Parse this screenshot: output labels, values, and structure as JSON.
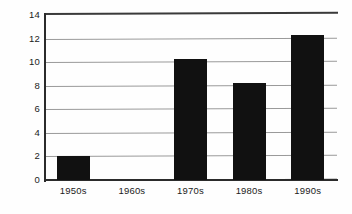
{
  "chart_data": {
    "type": "bar",
    "title": "",
    "subtitle": "",
    "xlabel": "",
    "ylabel": "",
    "categories": [
      "1950s",
      "1960s",
      "1970s",
      "1980s",
      "1990s"
    ],
    "values": [
      2.0,
      0,
      10.3,
      8.2,
      12.3
    ],
    "ylim": [
      0,
      14
    ],
    "ytick_values": [
      0,
      2,
      4,
      6,
      8,
      10,
      12,
      14
    ],
    "ytick_labels": [
      "0",
      "2",
      "4",
      "6",
      "8",
      "10",
      "12",
      "14"
    ],
    "grid": true,
    "grid_axis": "y",
    "legend": false,
    "legend_position": "none",
    "bar_color": "#111111",
    "gridline_color": "#9a9a9a",
    "axis_color": "#2b2b2b",
    "background_color": "#ffffff"
  }
}
